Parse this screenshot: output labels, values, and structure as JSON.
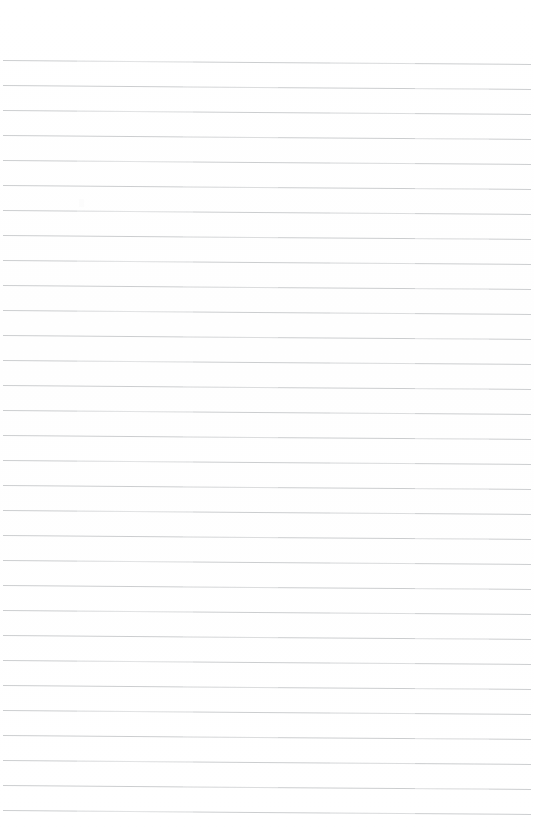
{
  "document": {
    "kind": "lined-notebook-page",
    "description": "Blank ruled notebook paper, scanned",
    "written_content": "",
    "page_width": 534,
    "page_height": 834,
    "background_color": "#ffffff",
    "rule_color": "#c9cbcd",
    "rule_thickness_px": 1,
    "rule_count": 31,
    "rule_spacing_px": 25,
    "first_rule_y": 60,
    "last_rule_y": 810,
    "rule_start_x": 3,
    "rule_end_x": 531,
    "top_margin_px": 60,
    "bottom_margin_px": 24,
    "scan_skew_drop_px": 4,
    "has_left_margin_rule": false,
    "has_header_text": false,
    "has_page_number": false,
    "rules": [
      {
        "y": 60
      },
      {
        "y": 85
      },
      {
        "y": 110
      },
      {
        "y": 135
      },
      {
        "y": 160
      },
      {
        "y": 185
      },
      {
        "y": 210
      },
      {
        "y": 235
      },
      {
        "y": 260
      },
      {
        "y": 285
      },
      {
        "y": 310
      },
      {
        "y": 335
      },
      {
        "y": 360
      },
      {
        "y": 385
      },
      {
        "y": 410
      },
      {
        "y": 435
      },
      {
        "y": 460
      },
      {
        "y": 485
      },
      {
        "y": 510
      },
      {
        "y": 535
      },
      {
        "y": 560
      },
      {
        "y": 585
      },
      {
        "y": 610
      },
      {
        "y": 635
      },
      {
        "y": 660
      },
      {
        "y": 685
      },
      {
        "y": 710
      },
      {
        "y": 735
      },
      {
        "y": 760
      },
      {
        "y": 785
      },
      {
        "y": 810
      }
    ],
    "speck": {
      "x": 79,
      "y": 199
    }
  }
}
